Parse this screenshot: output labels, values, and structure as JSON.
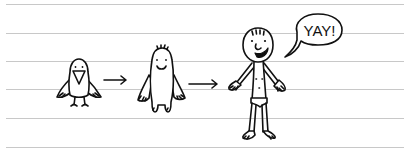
{
  "illustration": {
    "style": "hand-drawn doodle on lined notebook paper",
    "paper": {
      "background": "#ffffff",
      "line_color": "#c8c8c8",
      "ink_color": "#111111",
      "rule_count": 6
    },
    "panels": [
      {
        "figure": "bird",
        "description": "small crow-like bird with big beak"
      },
      {
        "figure": "arrow-1",
        "description": "right arrow"
      },
      {
        "figure": "creature",
        "description": "smiling blob creature with tuft of hair"
      },
      {
        "figure": "arrow-2",
        "description": "right arrow"
      },
      {
        "figure": "boy",
        "description": "stick-figure boy in underwear, shouting"
      }
    ],
    "speech_bubble": {
      "text": "YAY!"
    }
  }
}
